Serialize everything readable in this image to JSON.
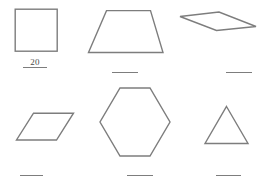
{
  "worksheet": {
    "title": "Geometric Shapes Answer Worksheet",
    "background_color": "#ffffff",
    "stroke_color": "#7d7d7d",
    "text_color": "#4a4a4a",
    "blank_answer_text": ""
  },
  "items": [
    {
      "shape_name": "square",
      "icon": "square-icon",
      "answer": "20",
      "answer_filled": true,
      "blank_width_px": 24
    },
    {
      "shape_name": "trapezoid",
      "icon": "trapezoid-icon",
      "answer": "",
      "answer_filled": false,
      "blank_width_px": 26
    },
    {
      "shape_name": "rhomboid",
      "icon": "rhomboid-icon",
      "answer": "",
      "answer_filled": false,
      "blank_width_px": 26
    },
    {
      "shape_name": "parallelogram",
      "icon": "parallelogram-icon",
      "answer": "",
      "answer_filled": false,
      "blank_width_px": 23
    },
    {
      "shape_name": "hexagon",
      "icon": "hexagon-icon",
      "answer": "",
      "answer_filled": false,
      "blank_width_px": 26
    },
    {
      "shape_name": "triangle",
      "icon": "triangle-icon",
      "answer": "",
      "answer_filled": false,
      "blank_width_px": 25
    }
  ]
}
